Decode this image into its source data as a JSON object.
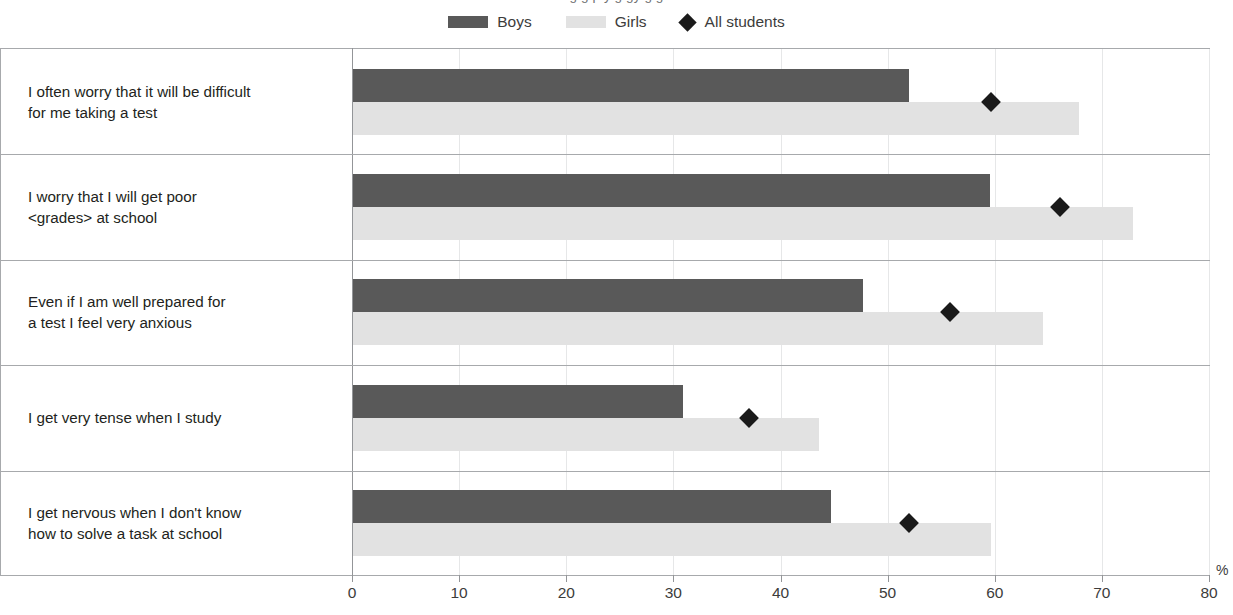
{
  "title": "g g p y g gy g g",
  "legend": {
    "position": "top-center",
    "items": [
      {
        "label": "Boys",
        "icon": "bar-swatch-dark",
        "color": "#595959"
      },
      {
        "label": "Girls",
        "icon": "bar-swatch-light",
        "color": "#e2e2e2"
      },
      {
        "label": "All students",
        "icon": "diamond-marker",
        "color": "#1a1a1a"
      }
    ]
  },
  "axis": {
    "unit_label": "%",
    "ticks": [
      "0",
      "10",
      "20",
      "30",
      "40",
      "50",
      "60",
      "70",
      "80"
    ]
  },
  "chart_data": {
    "type": "bar",
    "orientation": "horizontal",
    "title": "",
    "xlabel": "%",
    "ylabel": "",
    "xlim": [
      0,
      80
    ],
    "xticks": [
      0,
      10,
      20,
      30,
      40,
      50,
      60,
      70,
      80
    ],
    "grid": "vertical",
    "legend_position": "top-center",
    "categories": [
      "I often worry that it will be difficult\nfor me taking a test",
      "I worry that I will get poor\n<grades> at school",
      "Even if I am well prepared for\na test I feel very anxious",
      "I get very tense when I study",
      "I get nervous when I don't know\nhow to solve a task at school"
    ],
    "series": [
      {
        "name": "Boys",
        "type": "bar",
        "color": "#595959",
        "values": [
          51.9,
          59.5,
          47.6,
          30.8,
          44.6
        ]
      },
      {
        "name": "Girls",
        "type": "bar",
        "color": "#e2e2e2",
        "values": [
          67.8,
          72.8,
          64.4,
          43.5,
          59.6
        ]
      },
      {
        "name": "All students",
        "type": "marker",
        "color": "#1a1a1a",
        "values": [
          59.6,
          66.0,
          55.7,
          37.0,
          51.9
        ]
      }
    ]
  }
}
